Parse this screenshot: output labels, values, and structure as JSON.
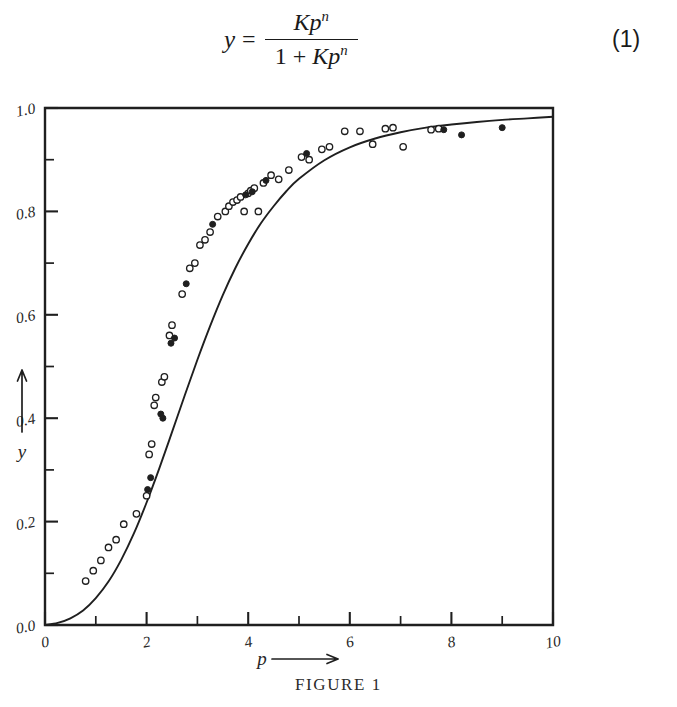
{
  "equation": {
    "lhs": "y",
    "equals": "=",
    "numerator_base": "Kp",
    "numerator_exp": "n",
    "denominator_one": "1 +",
    "denominator_base": "Kp",
    "denominator_exp": "n",
    "number": "(1)"
  },
  "figure": {
    "caption": "FIGURE 1"
  },
  "chart_data": {
    "type": "scatter",
    "title": "FIGURE 1",
    "xlabel": "p",
    "ylabel": "y",
    "xlabel_arrow": "→",
    "ylabel_arrow": "↑",
    "xlim": [
      0,
      10
    ],
    "ylim": [
      0.0,
      1.0
    ],
    "grid": false,
    "legend": "none",
    "x_major_ticks": [
      0,
      2,
      4,
      6,
      8,
      10
    ],
    "x_major_tick_labels": [
      "0",
      "2",
      "4",
      "6",
      "8",
      "10"
    ],
    "x_minor_ticks": [
      1,
      3,
      5,
      7,
      9
    ],
    "y_major_ticks": [
      0.0,
      0.2,
      0.4,
      0.6,
      0.8,
      1.0
    ],
    "y_major_tick_labels": [
      "0.0",
      "0.2",
      "0.4",
      "0.6",
      "0.8",
      "1.0"
    ],
    "y_minor_ticks": [
      0.1,
      0.3,
      0.5,
      0.7,
      0.9
    ],
    "fit_curve": {
      "name": "Hill isotherm fit",
      "equation": "y = Kp^n/(1 + Kp^n)",
      "K": 0.055,
      "n": 2.55,
      "points": [
        [
          0.0,
          0.0
        ],
        [
          0.25,
          0.004
        ],
        [
          0.5,
          0.013
        ],
        [
          0.75,
          0.028
        ],
        [
          1.0,
          0.052
        ],
        [
          1.25,
          0.084
        ],
        [
          1.5,
          0.126
        ],
        [
          1.75,
          0.177
        ],
        [
          2.0,
          0.237
        ],
        [
          2.25,
          0.303
        ],
        [
          2.5,
          0.373
        ],
        [
          2.75,
          0.444
        ],
        [
          3.0,
          0.513
        ],
        [
          3.25,
          0.578
        ],
        [
          3.5,
          0.638
        ],
        [
          3.75,
          0.691
        ],
        [
          4.0,
          0.737
        ],
        [
          4.25,
          0.777
        ],
        [
          4.5,
          0.81
        ],
        [
          4.75,
          0.839
        ],
        [
          5.0,
          0.863
        ],
        [
          5.5,
          0.899
        ],
        [
          6.0,
          0.924
        ],
        [
          6.5,
          0.941
        ],
        [
          7.0,
          0.953
        ],
        [
          7.5,
          0.962
        ],
        [
          8.0,
          0.968
        ],
        [
          8.5,
          0.973
        ],
        [
          9.0,
          0.977
        ],
        [
          9.5,
          0.98
        ],
        [
          10.0,
          0.983
        ]
      ]
    },
    "series": [
      {
        "name": "open circles",
        "marker": "open-circle",
        "points": [
          [
            0.8,
            0.085
          ],
          [
            0.95,
            0.105
          ],
          [
            1.1,
            0.125
          ],
          [
            1.25,
            0.15
          ],
          [
            1.4,
            0.165
          ],
          [
            1.55,
            0.195
          ],
          [
            1.8,
            0.215
          ],
          [
            2.0,
            0.25
          ],
          [
            2.05,
            0.33
          ],
          [
            2.1,
            0.35
          ],
          [
            2.15,
            0.425
          ],
          [
            2.18,
            0.44
          ],
          [
            2.3,
            0.47
          ],
          [
            2.35,
            0.48
          ],
          [
            2.45,
            0.56
          ],
          [
            2.5,
            0.58
          ],
          [
            2.7,
            0.64
          ],
          [
            2.85,
            0.69
          ],
          [
            2.95,
            0.7
          ],
          [
            3.05,
            0.735
          ],
          [
            3.15,
            0.745
          ],
          [
            3.25,
            0.76
          ],
          [
            3.4,
            0.79
          ],
          [
            3.55,
            0.8
          ],
          [
            3.62,
            0.81
          ],
          [
            3.7,
            0.818
          ],
          [
            3.78,
            0.822
          ],
          [
            3.85,
            0.828
          ],
          [
            3.92,
            0.8
          ],
          [
            4.0,
            0.835
          ],
          [
            4.05,
            0.84
          ],
          [
            4.12,
            0.845
          ],
          [
            4.2,
            0.8
          ],
          [
            4.3,
            0.855
          ],
          [
            4.45,
            0.87
          ],
          [
            4.6,
            0.862
          ],
          [
            4.8,
            0.88
          ],
          [
            5.05,
            0.905
          ],
          [
            5.2,
            0.9
          ],
          [
            5.45,
            0.92
          ],
          [
            5.6,
            0.925
          ],
          [
            5.9,
            0.955
          ],
          [
            6.2,
            0.955
          ],
          [
            6.45,
            0.93
          ],
          [
            6.7,
            0.96
          ],
          [
            6.85,
            0.962
          ],
          [
            7.05,
            0.925
          ],
          [
            7.6,
            0.958
          ],
          [
            7.75,
            0.96
          ]
        ]
      },
      {
        "name": "filled circles",
        "marker": "filled-circle",
        "points": [
          [
            2.02,
            0.262
          ],
          [
            2.08,
            0.285
          ],
          [
            2.28,
            0.408
          ],
          [
            2.32,
            0.4
          ],
          [
            2.48,
            0.545
          ],
          [
            2.55,
            0.555
          ],
          [
            2.78,
            0.66
          ],
          [
            3.3,
            0.775
          ],
          [
            3.95,
            0.832
          ],
          [
            4.08,
            0.838
          ],
          [
            4.35,
            0.86
          ],
          [
            5.15,
            0.912
          ],
          [
            7.85,
            0.958
          ],
          [
            8.2,
            0.948
          ],
          [
            9.0,
            0.962
          ]
        ]
      }
    ]
  }
}
